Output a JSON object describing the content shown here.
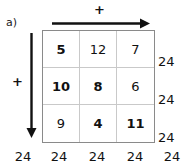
{
  "problem": {
    "label": "a)"
  },
  "axes": {
    "top": {
      "operator": "+",
      "arrow_icon": "arrow-right-icon",
      "direction": "right"
    },
    "left": {
      "operator": "+",
      "arrow_icon": "arrow-down-icon",
      "direction": "down"
    }
  },
  "grid": {
    "rows": 3,
    "columns": 3,
    "cells": [
      [
        {
          "value": "5",
          "bold": true
        },
        {
          "value": "12",
          "bold": false
        },
        {
          "value": "7",
          "bold": false
        }
      ],
      [
        {
          "value": "10",
          "bold": true
        },
        {
          "value": "8",
          "bold": true
        },
        {
          "value": "6",
          "bold": false
        }
      ],
      [
        {
          "value": "9",
          "bold": false
        },
        {
          "value": "4",
          "bold": true
        },
        {
          "value": "11",
          "bold": true
        }
      ]
    ]
  },
  "row_sums": [
    "24",
    "24",
    "24"
  ],
  "column_sums": [
    "24",
    "24",
    "24",
    "24",
    "24"
  ],
  "colors": {
    "ink": "#111111",
    "grid_inner_line": "#c9c9c9",
    "grid_outer_line": "#8a8a8a",
    "background": "#ffffff"
  }
}
